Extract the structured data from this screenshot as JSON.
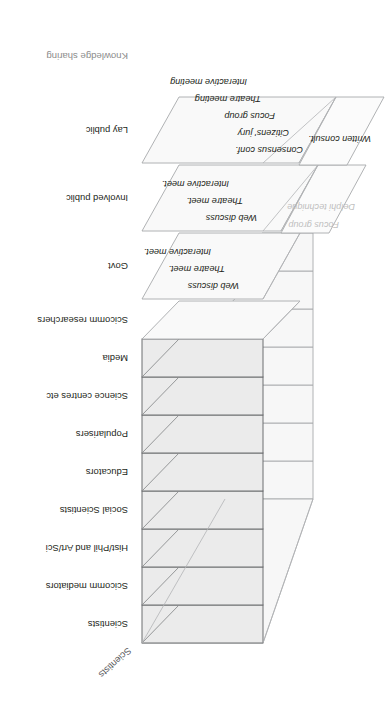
{
  "figure": {
    "title_diagonal": "Scientists",
    "axis_label": "Knowledge sharing",
    "bottom_note": "",
    "colors": {
      "slab_fill_shaded": "#ebebeb",
      "slab_fill_plain": "#f7f7f7",
      "stroke": "#6d6e71",
      "stroke_light": "#a7a9ac",
      "text": "#231f20",
      "text_muted": "#8c8c8c",
      "text_faded": "#bfbfbf"
    }
  },
  "rows": [
    {
      "label": "Scientists",
      "shaded": true,
      "methods": []
    },
    {
      "label": "Scicomm mediators",
      "shaded": true,
      "methods": []
    },
    {
      "label": "Hist/Phil and Art/Sci",
      "shaded": true,
      "methods": []
    },
    {
      "label": "Social Scientists",
      "shaded": true,
      "methods": []
    },
    {
      "label": "Educators",
      "shaded": true,
      "methods": []
    },
    {
      "label": "Popularisers",
      "shaded": true,
      "methods": []
    },
    {
      "label": "Science centres etc",
      "shaded": true,
      "methods": []
    },
    {
      "label": "Media",
      "shaded": true,
      "methods": []
    },
    {
      "label": "Scicomm researchers",
      "shaded": false,
      "methods": []
    },
    {
      "label": "Govt",
      "shaded": false,
      "methods": [
        {
          "text": "Web discuss",
          "faded": false
        },
        {
          "text": "Theatre meet.",
          "faded": false
        },
        {
          "text": "Interactive meet.",
          "faded": false
        }
      ]
    },
    {
      "label": "Involved public",
      "shaded": false,
      "methods": [
        {
          "text": "Web discuss",
          "faded": false
        },
        {
          "text": "Theatre meet.",
          "faded": false
        },
        {
          "text": "Interactive meet.",
          "faded": false
        }
      ]
    },
    {
      "label": "Lay public",
      "shaded": false,
      "methods": [
        {
          "text": "Consensus conf.",
          "faded": false
        },
        {
          "text": "Citizens' jury",
          "faded": false
        },
        {
          "text": "Focus group",
          "faded": false
        },
        {
          "text": "Theatre meeting",
          "faded": false
        },
        {
          "text": "Interactive meeting",
          "faded": false
        }
      ]
    }
  ],
  "side_methods": [
    {
      "text": "Delphi technique",
      "faded": true
    },
    {
      "text": "Focus group",
      "faded": true
    },
    {
      "text": "Written consult.",
      "faded": false
    }
  ]
}
